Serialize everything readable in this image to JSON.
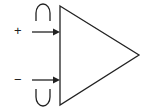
{
  "diagram": {
    "type": "amplifier-symbol",
    "inputs": [
      {
        "label": "+",
        "name": "non-inverting-input"
      },
      {
        "label": "−",
        "name": "inverting-input"
      }
    ],
    "colors": {
      "stroke": "#222222",
      "background": "#ffffff"
    }
  }
}
